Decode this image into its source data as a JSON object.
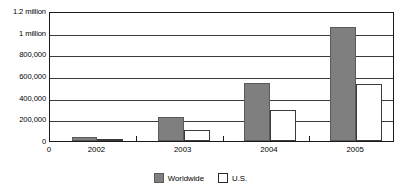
{
  "chart_data": {
    "type": "bar",
    "title": "",
    "subtitle": "",
    "xlabel": "",
    "ylabel": "",
    "categories": [
      "2002",
      "2003",
      "2004",
      "2005"
    ],
    "series": [
      {
        "name": "Worldwide",
        "color": "#7f7f7f",
        "values": [
          35000,
          220000,
          535000,
          1050000
        ]
      },
      {
        "name": "U.S.",
        "color": "#ffffff",
        "values": [
          20000,
          105000,
          290000,
          530000
        ]
      }
    ],
    "ylim": [
      0,
      1200000
    ],
    "ytick_values": [
      0,
      200000,
      400000,
      600000,
      800000,
      1000000,
      1200000
    ],
    "ytick_labels": [
      "0",
      "200,000",
      "400,000",
      "600,000",
      "800,000",
      "1 million",
      "1.2 million"
    ],
    "xtick_labels": [
      "0",
      "2002",
      "2003",
      "2004",
      "2005"
    ],
    "grid": true,
    "grid_axis": "y",
    "legend_position": "bottom-center",
    "legend": [
      "Worldwide",
      "U.S."
    ],
    "annotations": []
  },
  "axis": {
    "origin_label": "0"
  }
}
